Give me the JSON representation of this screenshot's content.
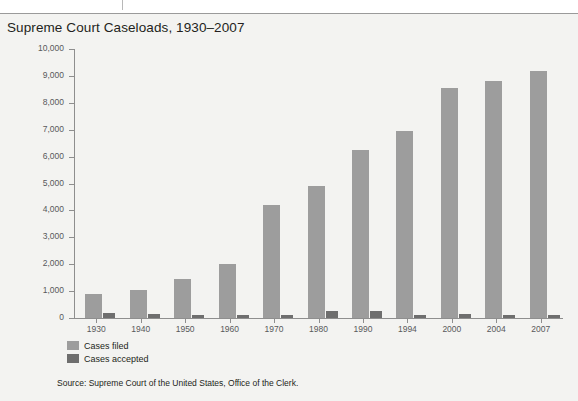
{
  "page": {
    "background_color": "#f3f3f1",
    "top_rule_color": "#9a9a9a"
  },
  "title": "Supreme Court Caseloads, 1930–2007",
  "source": "Source: Supreme Court of the United States, Office of the Clerk.",
  "legend": {
    "items": [
      {
        "label": "Cases filed",
        "color": "#9d9d9d"
      },
      {
        "label": "Cases accepted",
        "color": "#6e6e6e"
      }
    ]
  },
  "chart_data": {
    "type": "bar",
    "title": "Supreme Court Caseloads, 1930–2007",
    "xlabel": "",
    "ylabel": "",
    "ylim": [
      0,
      10000
    ],
    "ytick_labels": [
      "10,000",
      "9,000",
      "8,000",
      "7,000",
      "6,000",
      "5,000",
      "4,000",
      "3,000",
      "2,000",
      "1,000",
      "0"
    ],
    "ytick_values": [
      10000,
      9000,
      8000,
      7000,
      6000,
      5000,
      4000,
      3000,
      2000,
      1000,
      0
    ],
    "grid": false,
    "legend_position": "below-left",
    "categories": [
      "1930",
      "1940",
      "1950",
      "1960",
      "1970",
      "1980",
      "1990",
      "1994",
      "2000",
      "2004",
      "2007"
    ],
    "series": [
      {
        "name": "Cases filed",
        "color": "#9d9d9d",
        "values": [
          900,
          1050,
          1450,
          2000,
          4200,
          4900,
          6250,
          6950,
          8550,
          8800,
          9200
        ]
      },
      {
        "name": "Cases accepted",
        "color": "#6e6e6e",
        "values": [
          170,
          160,
          130,
          120,
          130,
          250,
          250,
          120,
          150,
          120,
          130
        ]
      }
    ]
  }
}
